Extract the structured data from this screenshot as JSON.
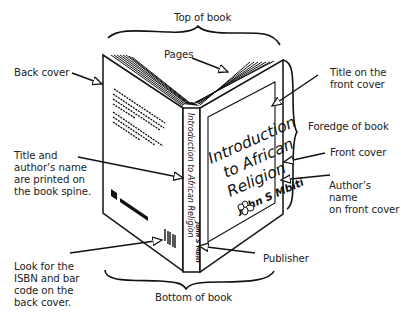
{
  "diagram": {
    "labels": {
      "top": "Top of book",
      "pages": "Pages",
      "back_cover": "Back cover",
      "title_front": "Title on the\nfront cover",
      "foredge": "Foredge of book",
      "front_cover": "Front cover",
      "spine": "Title and\nauthor’s name\nare printed on\nthe book spine.",
      "author_front": "Author’s name\non front cover",
      "isbn": "Look for the\nISBN and bar\ncode on the\nback cover.",
      "publisher": "Publisher",
      "bottom": "Bottom of book"
    },
    "book": {
      "cover_title_line1": "Introduction",
      "cover_title_line2": "to African",
      "cover_title_line3": "Religion",
      "cover_author": "John S Mbiti",
      "spine_text": "Introduction to African Religion",
      "spine_author": "John S Mbiti"
    },
    "colors": {
      "ink": "#111111",
      "label_text": "#222222",
      "background": "#ffffff"
    }
  }
}
